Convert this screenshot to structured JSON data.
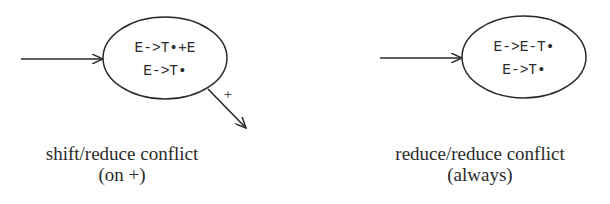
{
  "diagrams": [
    {
      "state": {
        "items": [
          "E->T•+E",
          "E->T•"
        ]
      },
      "outgoing_edge_label": "+",
      "caption": {
        "line1": "shift/reduce conflict",
        "line2": "(on +)"
      }
    },
    {
      "state": {
        "items": [
          "E->E-T•",
          "E->T•"
        ]
      },
      "caption": {
        "line1": "reduce/reduce conflict",
        "line2": "(always)"
      }
    }
  ]
}
